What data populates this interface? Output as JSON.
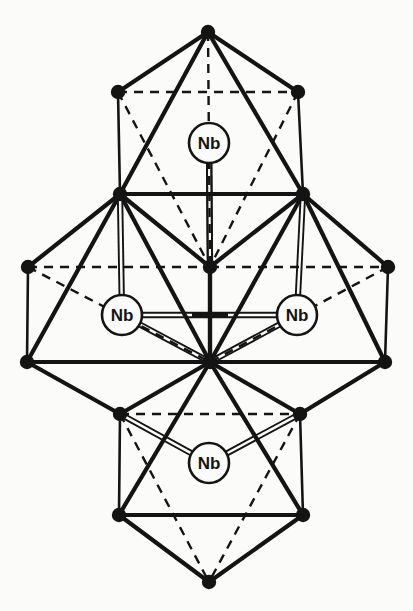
{
  "figure": {
    "kind": "crystal-structure-diagram",
    "background_color": "#fbfbfa",
    "ink_color": "#141414",
    "circle_fill": "#fbfbfa"
  },
  "style": {
    "solid_edge_width": 4.2,
    "thin_edge_width": 2.6,
    "dashed_edge_width": 2.4,
    "dash_pattern": "9 7",
    "bond_line_width": 1.9,
    "bond_gap": 4.4,
    "vertex_radius": 7.2,
    "atom_circle_radius": 20,
    "atom_circle_stroke": 2.6
  },
  "atoms": [
    {
      "id": "nb-top",
      "label": "Nb",
      "cx": 209,
      "cy": 143,
      "r": 20,
      "name": "atom-nb-top"
    },
    {
      "id": "nb-left",
      "label": "Nb",
      "cx": 122,
      "cy": 315,
      "r": 20,
      "name": "atom-nb-left"
    },
    {
      "id": "nb-right",
      "label": "Nb",
      "cx": 297,
      "cy": 315,
      "r": 20,
      "name": "atom-nb-right"
    },
    {
      "id": "nb-bottom",
      "label": "Nb",
      "cx": 209,
      "cy": 463,
      "r": 20,
      "name": "atom-nb-bottom"
    }
  ],
  "center_marker": {
    "id": "nb-center",
    "cx": 210,
    "cy": 315,
    "arm_half_length": 18,
    "name": "atom-nb-center-cross"
  },
  "vertices": [
    {
      "id": "T",
      "x": 208,
      "y": 32,
      "name": "vertex-top-apex"
    },
    {
      "id": "TL",
      "x": 118,
      "y": 92,
      "name": "vertex-top-back-left"
    },
    {
      "id": "TR",
      "x": 298,
      "y": 92,
      "name": "vertex-top-back-right"
    },
    {
      "id": "ML",
      "x": 120,
      "y": 194,
      "name": "vertex-upper-mid-left"
    },
    {
      "id": "MR",
      "x": 303,
      "y": 194,
      "name": "vertex-upper-mid-right"
    },
    {
      "id": "FL",
      "x": 28,
      "y": 267,
      "name": "vertex-far-left-back"
    },
    {
      "id": "C",
      "x": 210,
      "y": 267,
      "name": "vertex-center-upper"
    },
    {
      "id": "FR",
      "x": 388,
      "y": 267,
      "name": "vertex-far-right-back"
    },
    {
      "id": "BLF",
      "x": 27,
      "y": 362,
      "name": "vertex-far-left-front"
    },
    {
      "id": "CL",
      "x": 210,
      "y": 362,
      "name": "vertex-center-lower"
    },
    {
      "id": "BRF",
      "x": 385,
      "y": 362,
      "name": "vertex-far-right-front"
    },
    {
      "id": "LL",
      "x": 120,
      "y": 414,
      "name": "vertex-lower-mid-left"
    },
    {
      "id": "LR",
      "x": 300,
      "y": 414,
      "name": "vertex-lower-mid-right"
    },
    {
      "id": "BL",
      "x": 119,
      "y": 515,
      "name": "vertex-bottom-front-left"
    },
    {
      "id": "BR",
      "x": 303,
      "y": 515,
      "name": "vertex-bottom-front-right"
    },
    {
      "id": "B",
      "x": 209,
      "y": 582,
      "name": "vertex-bottom-apex"
    }
  ],
  "edges_solid": [
    {
      "from": "T",
      "to": "TL",
      "w": 4.2
    },
    {
      "from": "T",
      "to": "TR",
      "w": 4.2
    },
    {
      "from": "T",
      "to": "ML",
      "w": 4.2
    },
    {
      "from": "T",
      "to": "MR",
      "w": 4.2
    },
    {
      "from": "TL",
      "to": "ML",
      "w": 2.6
    },
    {
      "from": "TR",
      "to": "MR",
      "w": 2.6
    },
    {
      "from": "ML",
      "to": "MR",
      "w": 4.2
    },
    {
      "from": "ML",
      "to": "FL",
      "w": 4.2
    },
    {
      "from": "ML",
      "to": "BLF",
      "w": 4.2
    },
    {
      "from": "ML",
      "to": "C",
      "w": 4.2
    },
    {
      "from": "ML",
      "to": "CL",
      "w": 4.2
    },
    {
      "from": "MR",
      "to": "FR",
      "w": 4.2
    },
    {
      "from": "MR",
      "to": "BRF",
      "w": 4.2
    },
    {
      "from": "MR",
      "to": "C",
      "w": 4.2
    },
    {
      "from": "MR",
      "to": "CL",
      "w": 4.2
    },
    {
      "from": "FL",
      "to": "BLF",
      "w": 2.6
    },
    {
      "from": "FR",
      "to": "BRF",
      "w": 2.6
    },
    {
      "from": "BLF",
      "to": "BRF",
      "w": 4.2
    },
    {
      "from": "BLF",
      "to": "LL",
      "w": 4.2
    },
    {
      "from": "BRF",
      "to": "LR",
      "w": 4.2
    },
    {
      "from": "CL",
      "to": "LL",
      "w": 4.2
    },
    {
      "from": "CL",
      "to": "LR",
      "w": 4.2
    },
    {
      "from": "CL",
      "to": "BL",
      "w": 4.2
    },
    {
      "from": "CL",
      "to": "BR",
      "w": 4.2
    },
    {
      "from": "C",
      "to": "CL",
      "w": 4.2
    },
    {
      "from": "LL",
      "to": "BL",
      "w": 2.6
    },
    {
      "from": "LR",
      "to": "BR",
      "w": 2.6
    },
    {
      "from": "BL",
      "to": "BR",
      "w": 4.2
    },
    {
      "from": "BL",
      "to": "B",
      "w": 4.2
    },
    {
      "from": "BR",
      "to": "B",
      "w": 4.2
    }
  ],
  "edges_dashed": [
    {
      "from": "TL",
      "to": "TR"
    },
    {
      "from": "TL",
      "to": "C"
    },
    {
      "from": "TR",
      "to": "C"
    },
    {
      "from": "FL",
      "to": "C"
    },
    {
      "from": "C",
      "to": "FR"
    },
    {
      "from": "FL",
      "to": "CL"
    },
    {
      "from": "FR",
      "to": "CL"
    },
    {
      "from": "LL",
      "to": "LR"
    },
    {
      "from": "LL",
      "to": "B"
    },
    {
      "from": "LR",
      "to": "B"
    },
    {
      "from": "T",
      "to": "C"
    }
  ],
  "bonds_double": [
    {
      "from_atom": "nb-top",
      "to_vertex": "C",
      "name": "bond-nb-top-center"
    },
    {
      "from_atom": "nb-top",
      "to_vertex": "C",
      "variant": "right",
      "name": "bond-nb-top-center-b"
    },
    {
      "from_atom": "nb-left",
      "to_vertex": "ML",
      "name": "bond-nb-left-upper"
    },
    {
      "from_atom": "nb-left",
      "to_vertex": "CL",
      "name": "bond-nb-left-lower"
    },
    {
      "from_atom": "nb-right",
      "to_vertex": "MR",
      "name": "bond-nb-right-upper"
    },
    {
      "from_atom": "nb-right",
      "to_vertex": "CL",
      "name": "bond-nb-right-lower"
    },
    {
      "from_atom": "nb-bottom",
      "to_vertex": "LL",
      "name": "bond-nb-bottom-left"
    },
    {
      "from_atom": "nb-bottom",
      "to_vertex": "LR",
      "name": "bond-nb-bottom-right"
    },
    {
      "from_atom": "nb-left",
      "to_atom": "nb-center",
      "name": "bond-nb-left-center"
    },
    {
      "from_atom": "nb-right",
      "to_atom": "nb-center",
      "name": "bond-nb-right-center"
    }
  ]
}
